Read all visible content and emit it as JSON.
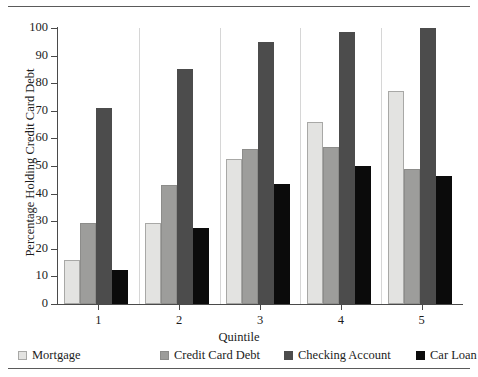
{
  "chart_data": {
    "type": "bar",
    "title": "",
    "xlabel": "Quintile",
    "ylabel": "Percentage Holding Credit Card Debt",
    "categories": [
      "1",
      "2",
      "3",
      "4",
      "5"
    ],
    "ylim": [
      0,
      100
    ],
    "yticks": [
      0,
      10,
      20,
      30,
      40,
      50,
      60,
      70,
      80,
      90,
      100
    ],
    "ytick_labels": [
      "0",
      "10",
      "20",
      "30",
      "40",
      "50",
      "60",
      "70",
      "80",
      "90",
      "100"
    ],
    "grid": false,
    "legend_position": "below-axis",
    "series": [
      {
        "name": "Mortgage",
        "color": "#e3e3e1",
        "values": [
          16,
          29.5,
          52.5,
          66,
          77
        ]
      },
      {
        "name": "Credit Card Debt",
        "color": "#9d9d9b",
        "values": [
          29.5,
          43,
          56,
          57,
          49
        ]
      },
      {
        "name": "Checking Account",
        "color": "#4c4c4c",
        "values": [
          71,
          85,
          95,
          98.5,
          100
        ]
      },
      {
        "name": "Car Loan",
        "color": "#0b0b0b",
        "values": [
          12.5,
          27.5,
          43.5,
          50,
          46.5
        ]
      }
    ]
  },
  "legend": {
    "items": [
      {
        "label": "Mortgage"
      },
      {
        "label": "Credit Card Debt"
      },
      {
        "label": "Checking Account"
      },
      {
        "label": "Car Loan"
      }
    ]
  }
}
